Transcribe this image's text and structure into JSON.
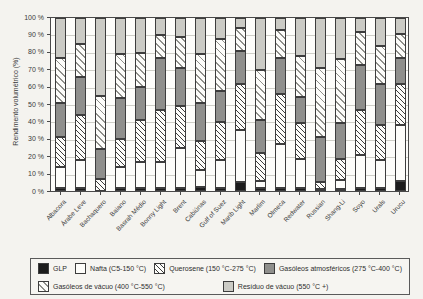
{
  "figure": {
    "y_axis_title": "Rendimento volumétrico (%)"
  },
  "chart_data": {
    "type": "bar",
    "stacked": true,
    "title": "",
    "xlabel": "",
    "ylabel": "Rendimento volumétrico (%)",
    "ylim": [
      0,
      100
    ],
    "grid": true,
    "legend_position": "bottom",
    "y_ticks": [
      "0 %",
      "10 %",
      "20 %",
      "30 %",
      "40 %",
      "50 %",
      "60 %",
      "70 %",
      "80 %",
      "90 %",
      "100 %"
    ],
    "categories": [
      "Albacora",
      "Árabe Leve",
      "Bachaquero",
      "Baiano",
      "Basrah Médio",
      "Bonny Light",
      "Brent",
      "Cabiúnas",
      "Gulf of Suez",
      "Marib Light",
      "Marlim",
      "Olmeca",
      "Redwater",
      "Russian",
      "Shang-Li",
      "Soyo",
      "Urals",
      "Urucu"
    ],
    "series": [
      {
        "name": "GLP",
        "pattern": "solid-black",
        "values": [
          2,
          1.5,
          0,
          2,
          2,
          1.5,
          2,
          2.5,
          2,
          5,
          1.5,
          2,
          2,
          0,
          0.5,
          2,
          2,
          6
        ]
      },
      {
        "name": "Nafta (C5-150 °C)",
        "pattern": "solid-white",
        "values": [
          12,
          16.5,
          0,
          12,
          15,
          15.5,
          23,
          9.5,
          16,
          30,
          4.5,
          25,
          18,
          1,
          5.5,
          19,
          16,
          32
        ]
      },
      {
        "name": "Querosene (150 °C-275 °C)",
        "pattern": "hatch-dense",
        "values": [
          17,
          26,
          7,
          16,
          24,
          30,
          24,
          17,
          22,
          27,
          16,
          29,
          23,
          4,
          12,
          26,
          20,
          24
        ]
      },
      {
        "name": "Gasóleos atmosféricos (275 °C-400 °C)",
        "pattern": "solid-darkgray",
        "values": [
          20,
          22,
          17,
          24,
          19,
          30,
          22,
          22,
          18,
          19,
          19,
          21,
          17,
          26,
          21,
          26,
          24,
          15
        ]
      },
      {
        "name": "Gasóleos de vácuo (400 °C-550 °C)",
        "pattern": "hatch-light",
        "values": [
          26,
          19,
          31,
          25,
          20,
          13,
          18,
          28,
          30,
          13,
          29,
          16,
          26,
          40,
          37,
          19,
          22,
          14
        ]
      },
      {
        "name": "Resíduo de vácuo (550 °C +)",
        "pattern": "solid-lightgray",
        "values": [
          23,
          15,
          45,
          21,
          20,
          10,
          11,
          21,
          12,
          6,
          30,
          7,
          24,
          29,
          24,
          8,
          16,
          9
        ]
      }
    ],
    "colors": {
      "black": "#1c1c1c",
      "dark_gray": "#8f8f8c",
      "light_gray": "#cbcbc5",
      "hatch_line": "#3c3c3c",
      "grid_line": "#cfcfc8",
      "paper": "#f4f3ef"
    }
  },
  "legend": {
    "rows": [
      [
        0,
        1,
        2,
        3
      ],
      [
        4,
        5
      ]
    ]
  }
}
